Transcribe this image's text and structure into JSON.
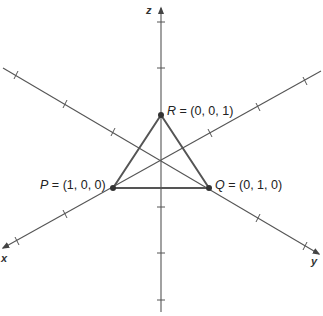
{
  "diagram": {
    "type": "3d-coordinate-axes",
    "axes": {
      "x": {
        "label": "x"
      },
      "y": {
        "label": "y"
      },
      "z": {
        "label": "z"
      }
    },
    "points": [
      {
        "name": "P",
        "equals": "=",
        "coords": "(1, 0, 0)"
      },
      {
        "name": "Q",
        "equals": "=",
        "coords": "(0, 1, 0)"
      },
      {
        "name": "R",
        "equals": "=",
        "coords": "(0, 0, 1)"
      }
    ],
    "shape": "triangle PQR",
    "colors": {
      "lines": "#555555",
      "points": "#333333",
      "text": "#222222",
      "background": "#ffffff"
    }
  }
}
